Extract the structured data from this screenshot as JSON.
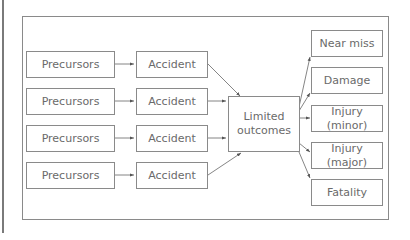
{
  "diagram": {
    "precursors": [
      "Precursors",
      "Precursors",
      "Precursors",
      "Precursors"
    ],
    "accidents": [
      "Accident",
      "Accident",
      "Accident",
      "Accident"
    ],
    "center": {
      "line1": "Limited",
      "line2": "outcomes"
    },
    "outcomes": [
      "Near miss",
      "Damage",
      "Injury (minor)",
      "Injury (major)",
      "Fatality"
    ]
  }
}
